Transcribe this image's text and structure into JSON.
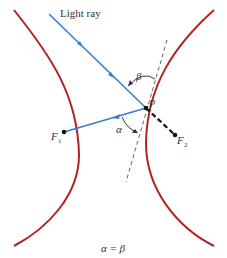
{
  "labels": {
    "light_ray": "Light ray",
    "beta": "β",
    "alpha": "α",
    "point_p": "P",
    "focus1": "F",
    "focus1_sub": "1",
    "focus2": "F",
    "focus2_sub": "2",
    "equation": "α = β"
  },
  "colors": {
    "hyperbola": "#b22222",
    "ray": "#3a7dc9",
    "dashed_tangent": "#555555",
    "focal_line": "#111111"
  }
}
